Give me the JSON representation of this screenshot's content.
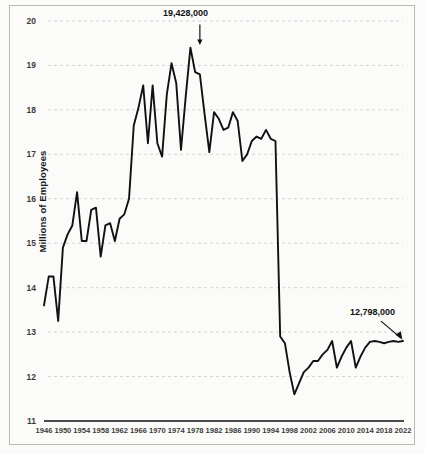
{
  "chart_data": {
    "type": "line",
    "title": "",
    "subtitle": "",
    "xlabel": "",
    "ylabel": "Millions of Employees",
    "xlim": [
      1946,
      2022
    ],
    "ylim": [
      11,
      20
    ],
    "grid": true,
    "legend": "none",
    "y_ticks": [
      "20",
      "19",
      "18",
      "17",
      "16",
      "15",
      "14",
      "13",
      "12",
      "11"
    ],
    "y_tick_values": [
      20,
      19,
      18,
      17,
      16,
      15,
      14,
      13,
      12,
      11
    ],
    "x_ticks": [
      "1946",
      "1950",
      "1954",
      "1958",
      "1962",
      "1966",
      "1970",
      "1974",
      "1978",
      "1982",
      "1986",
      "1990",
      "1994",
      "1998",
      "2002",
      "2006",
      "2010",
      "2014",
      "2018",
      "2022"
    ],
    "x_tick_values": [
      1946,
      1950,
      1954,
      1958,
      1962,
      1966,
      1970,
      1974,
      1978,
      1982,
      1986,
      1990,
      1994,
      1998,
      2002,
      2006,
      2010,
      2014,
      2018,
      2022
    ],
    "series": [
      {
        "name": "Manufacturing Employees",
        "color": "#111111",
        "x": [
          1946,
          1947,
          1948,
          1949,
          1950,
          1951,
          1952,
          1953,
          1954,
          1955,
          1956,
          1957,
          1958,
          1959,
          1960,
          1961,
          1962,
          1963,
          1964,
          1965,
          1966,
          1967,
          1968,
          1969,
          1970,
          1971,
          1972,
          1973,
          1974,
          1975,
          1976,
          1977,
          1978,
          1979,
          1980,
          1981,
          1982,
          1983,
          1984,
          1985,
          1986,
          1987,
          1988,
          1989,
          1990,
          1991,
          1992,
          1993,
          1994,
          1995,
          1996,
          1997,
          1998,
          1999,
          2000,
          2001,
          2002,
          2003,
          2004,
          2005,
          2006,
          2007,
          2008,
          2009,
          2010,
          2011,
          2012,
          2013,
          2014,
          2015,
          2016,
          2017,
          2018,
          2019,
          2020,
          2021,
          2022
        ],
        "values": [
          13.6,
          14.25,
          14.25,
          13.25,
          14.9,
          15.2,
          15.4,
          16.15,
          15.05,
          15.05,
          15.75,
          15.8,
          14.7,
          15.4,
          15.45,
          15.05,
          15.55,
          15.65,
          16.0,
          17.65,
          18.05,
          18.55,
          17.25,
          18.55,
          17.25,
          16.95,
          18.35,
          19.05,
          18.6,
          17.1,
          18.3,
          19.4,
          18.85,
          18.8,
          17.9,
          17.05,
          17.95,
          17.8,
          17.55,
          17.6,
          17.95,
          17.75,
          16.85,
          17.0,
          17.3,
          17.4,
          17.35,
          17.55,
          17.35,
          17.3,
          12.9,
          12.75,
          12.1,
          11.6,
          11.85,
          12.1,
          12.2,
          12.35,
          12.35,
          12.5,
          12.6,
          12.8,
          12.2,
          12.45,
          12.65,
          12.8,
          12.2,
          12.45,
          12.65,
          12.78,
          12.8,
          12.78,
          12.75,
          12.78,
          12.8,
          12.78,
          12.8
        ]
      }
    ],
    "annotations": [
      {
        "label": "19,428,000",
        "x": 1979,
        "y": 19.428,
        "arrow": "down"
      },
      {
        "label": "12,798,000",
        "x": 2022,
        "y": 12.798,
        "arrow": "down-right"
      }
    ]
  },
  "axis": {
    "y_title": "Millions of Employees"
  },
  "annotations": {
    "peak_label": "19,428,000",
    "end_label": "12,798,000"
  },
  "y_ticks": {
    "t0": "20",
    "t1": "19",
    "t2": "18",
    "t3": "17",
    "t4": "16",
    "t5": "15",
    "t6": "14",
    "t7": "13",
    "t8": "12",
    "t9": "11"
  },
  "x_ticks": {
    "t0": "1946",
    "t1": "1950",
    "t2": "1954",
    "t3": "1958",
    "t4": "1962",
    "t5": "1966",
    "t6": "1970",
    "t7": "1974",
    "t8": "1978",
    "t9": "1982",
    "t10": "1986",
    "t11": "1990",
    "t12": "1994",
    "t13": "1998",
    "t14": "2002",
    "t15": "2006",
    "t16": "2010",
    "t17": "2014",
    "t18": "2018",
    "t19": "2022"
  },
  "colors": {
    "line": "#111111",
    "grid": "#c9c9c9",
    "axis": "#111111",
    "background": "#fbfbfa",
    "border": "#b9b9b6"
  }
}
